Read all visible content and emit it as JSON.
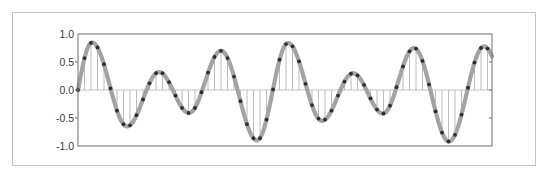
{
  "chart_data": {
    "type": "line",
    "subtype": "stem-with-sampled-curve",
    "title": "",
    "xlabel": "",
    "ylabel": "",
    "ylim": [
      -1.0,
      1.0
    ],
    "yticks": [
      1.0,
      0.5,
      0.0,
      -0.5,
      -1.0
    ],
    "ytick_labels": [
      "1.0",
      "0.5",
      "0.0",
      "-0.5",
      "-1.0"
    ],
    "x_tick_labels": [],
    "grid": false,
    "legend": null,
    "series": [
      {
        "name": "continuous signal",
        "style": "thick gray curve"
      },
      {
        "name": "samples",
        "style": "black dots with light gray stems to zero line",
        "x": [
          0,
          1,
          2,
          3,
          4,
          5,
          6,
          7,
          8,
          9,
          10,
          11,
          12,
          13,
          14,
          15,
          16,
          17,
          18,
          19,
          20,
          21,
          22,
          23,
          24,
          25,
          26,
          27,
          28,
          29,
          30,
          31,
          32,
          33,
          34,
          35,
          36,
          37,
          38,
          39,
          40,
          41,
          42,
          43,
          44,
          45,
          46,
          47,
          48,
          49,
          50,
          51,
          52,
          53,
          54,
          55,
          56,
          57,
          58,
          59,
          60,
          61,
          62,
          63
        ],
        "values": [
          0.0,
          0.57,
          0.84,
          0.76,
          0.46,
          0.03,
          -0.37,
          -0.61,
          -0.63,
          -0.45,
          -0.17,
          0.12,
          0.3,
          0.3,
          0.14,
          -0.1,
          -0.32,
          -0.41,
          -0.32,
          -0.04,
          0.31,
          0.59,
          0.7,
          0.57,
          0.24,
          -0.2,
          -0.61,
          -0.86,
          -0.86,
          -0.53,
          0.01,
          0.54,
          0.82,
          0.78,
          0.51,
          0.11,
          -0.27,
          -0.51,
          -0.53,
          -0.37,
          -0.1,
          0.15,
          0.29,
          0.26,
          0.09,
          -0.15,
          -0.35,
          -0.42,
          -0.28,
          0.05,
          0.42,
          0.69,
          0.74,
          0.52,
          0.1,
          -0.38,
          -0.76,
          -0.92,
          -0.8,
          -0.44,
          0.04,
          0.49,
          0.75,
          0.74
        ]
      }
    ],
    "extrema": [
      {
        "x": 0.0,
        "y": 0.0
      },
      {
        "x": 2.15,
        "y": 0.85
      },
      {
        "x": 7.54,
        "y": -0.65
      },
      {
        "x": 12.46,
        "y": 0.32
      },
      {
        "x": 17.08,
        "y": -0.41
      },
      {
        "x": 22.0,
        "y": 0.7
      },
      {
        "x": 27.54,
        "y": -0.9
      },
      {
        "x": 32.31,
        "y": 0.84
      },
      {
        "x": 37.54,
        "y": -0.55
      },
      {
        "x": 42.31,
        "y": 0.3
      },
      {
        "x": 46.92,
        "y": -0.42
      },
      {
        "x": 51.69,
        "y": 0.75
      },
      {
        "x": 57.08,
        "y": -0.92
      },
      {
        "x": 62.46,
        "y": 0.78
      },
      {
        "x": 63.69,
        "y": 0.6
      }
    ],
    "x_range": [
      0,
      63.69
    ]
  },
  "colors": {
    "curve": "#a3a3a3",
    "dots": "#2e2e2e",
    "stems": "#bdbdbd",
    "zero_line": "#c2c2c2",
    "axes": "#6e6e6e",
    "frame": "#c4c4c4",
    "labels": "#3a3a3a"
  }
}
